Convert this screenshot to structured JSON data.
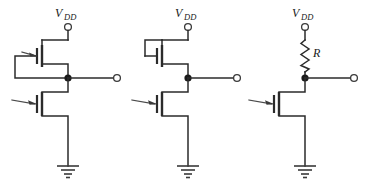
{
  "figure": {
    "title": "",
    "background_color": "#ffffff",
    "line_color": "#2b2b2b",
    "width": 370,
    "height": 186
  },
  "circuits": [
    {
      "id": "circuit-1",
      "name": "cmos-inverter-diode-connected-pmos-load",
      "supply_label_main": "V",
      "supply_label_sub": "DD",
      "has_resistor": false,
      "load_device": "pmos-transistor",
      "driver_device": "nmos-transistor",
      "has_feedback_wire": true,
      "has_input_arrow": true,
      "has_output_terminal": true,
      "has_ground": true
    },
    {
      "id": "circuit-2",
      "name": "nmos-inverter-with-load-transistor",
      "supply_label_main": "V",
      "supply_label_sub": "DD",
      "has_resistor": false,
      "load_device": "nmos-load-transistor",
      "driver_device": "nmos-transistor",
      "has_feedback_wire": false,
      "has_input_arrow": true,
      "has_output_terminal": true,
      "has_ground": true
    },
    {
      "id": "circuit-3",
      "name": "nmos-inverter-with-resistor-load",
      "supply_label_main": "V",
      "supply_label_sub": "DD",
      "has_resistor": true,
      "resistor_label": "R",
      "load_device": "resistor",
      "driver_device": "nmos-transistor",
      "has_feedback_wire": false,
      "has_input_arrow": true,
      "has_output_terminal": true,
      "has_ground": true
    }
  ]
}
